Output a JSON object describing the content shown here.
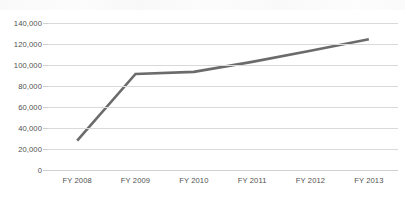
{
  "chart_data": {
    "type": "line",
    "title": "",
    "xlabel": "",
    "ylabel": "",
    "categories": [
      "FY 2008",
      "FY 2009",
      "FY 2010",
      "FY 2011",
      "FY 2012",
      "FY 2013"
    ],
    "series": [
      {
        "name": "",
        "values": [
          28000,
          91500,
          93500,
          103000,
          113500,
          124500
        ],
        "color": "#6b6b6b",
        "line_width": 2.6,
        "markers": false
      }
    ],
    "ylim": [
      0,
      140000
    ],
    "yticks": [
      0,
      20000,
      40000,
      60000,
      80000,
      100000,
      120000,
      140000
    ],
    "ytick_labels": [
      "0",
      "20,000",
      "40,000",
      "60,000",
      "80,000",
      "100,000",
      "120,000",
      "140,000"
    ],
    "grid": {
      "horizontal": true,
      "vertical": false,
      "color": "#d9d9d9"
    },
    "legend": {
      "visible": false,
      "position": "none",
      "entries": []
    },
    "annotations": []
  },
  "axes": {
    "y_labels": [
      "140,000",
      "120,000",
      "100,000",
      "80,000",
      "60,000",
      "40,000",
      "20,000",
      "0"
    ],
    "x_labels": [
      "FY 2008",
      "FY 2009",
      "FY 2010",
      "FY 2011",
      "FY 2012",
      "FY 2013"
    ]
  },
  "artifact": {
    "top_bleed_text": ""
  }
}
